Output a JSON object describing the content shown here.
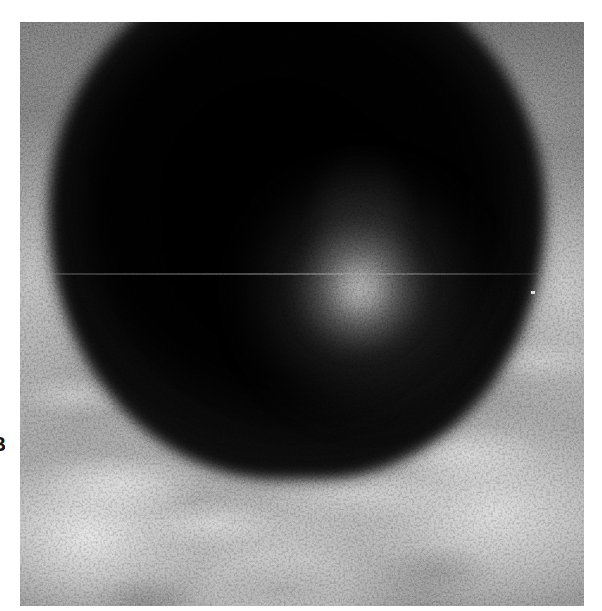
{
  "page": {
    "background_color": "#ffffff",
    "width": 602,
    "height": 611
  },
  "panel_label": {
    "text": "B",
    "note": "cropped at left page margin"
  },
  "figure": {
    "kind": "grayscale-micrograph",
    "panel": {
      "x": 20,
      "y": 22,
      "width": 564,
      "height": 584,
      "border": "none"
    },
    "features": [
      {
        "name": "dark-circular-mass",
        "center_x": 302,
        "center_y": 219,
        "radius_x": 249,
        "radius_y": 261,
        "tone": "#070707"
      },
      {
        "name": "bright-focal-spot",
        "center_x": 340,
        "center_y": 267,
        "radius": 62,
        "tone": "#cdcdcd"
      },
      {
        "name": "light-tissue-field",
        "region": "lower-third-and-margins",
        "tone": "#a8a8a8"
      },
      {
        "name": "scanline-artifact",
        "y": 251,
        "tone": "#aaaaaa"
      },
      {
        "name": "hot-pixel",
        "x": 513,
        "y": 270,
        "tone": "#e8e8e8"
      }
    ],
    "palette": {
      "darkest": "#050505",
      "mass_body": "#0c0c0c",
      "mid_gray": "#6e6e6e",
      "light_gray": "#a8a8a8",
      "highlight": "#ededed",
      "page": "#ffffff"
    }
  }
}
